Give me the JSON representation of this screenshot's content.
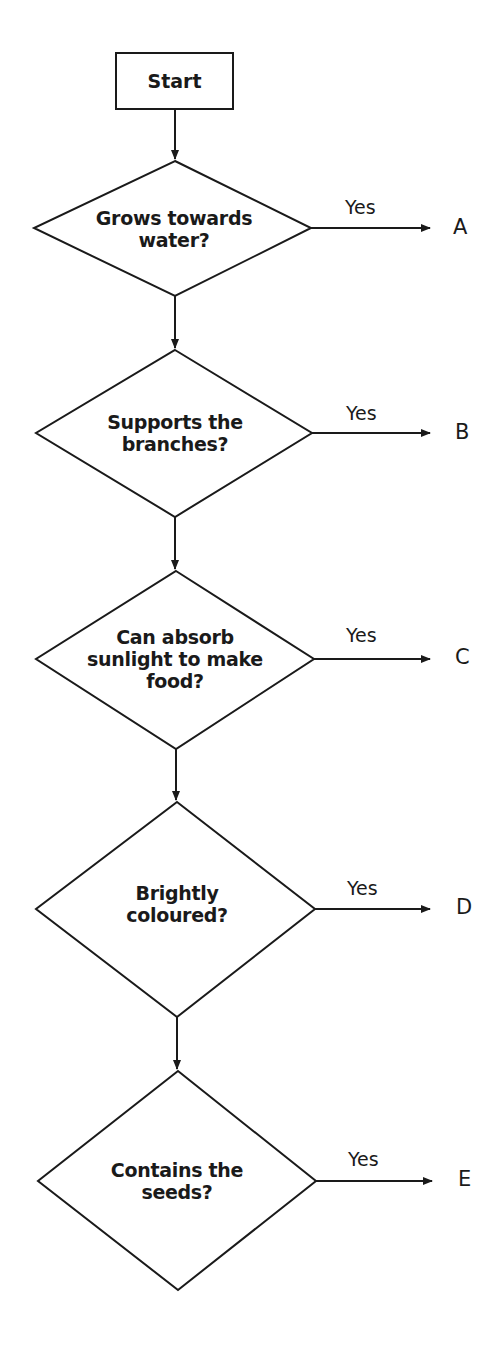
{
  "flowchart": {
    "start": {
      "label": "Start"
    },
    "yes_label": "Yes",
    "colors": {
      "stroke": "#1a1a1a",
      "background": "#ffffff"
    },
    "decisions": [
      {
        "lines": [
          "Grows towards",
          "water?"
        ],
        "yes_outcome": "A"
      },
      {
        "lines": [
          "Supports the",
          "branches?"
        ],
        "yes_outcome": "B"
      },
      {
        "lines": [
          "Can absorb",
          "sunlight to make",
          "food?"
        ],
        "yes_outcome": "C"
      },
      {
        "lines": [
          "Brightly",
          "coloured?"
        ],
        "yes_outcome": "D"
      },
      {
        "lines": [
          "Contains the",
          "seeds?"
        ],
        "yes_outcome": "E"
      }
    ]
  }
}
